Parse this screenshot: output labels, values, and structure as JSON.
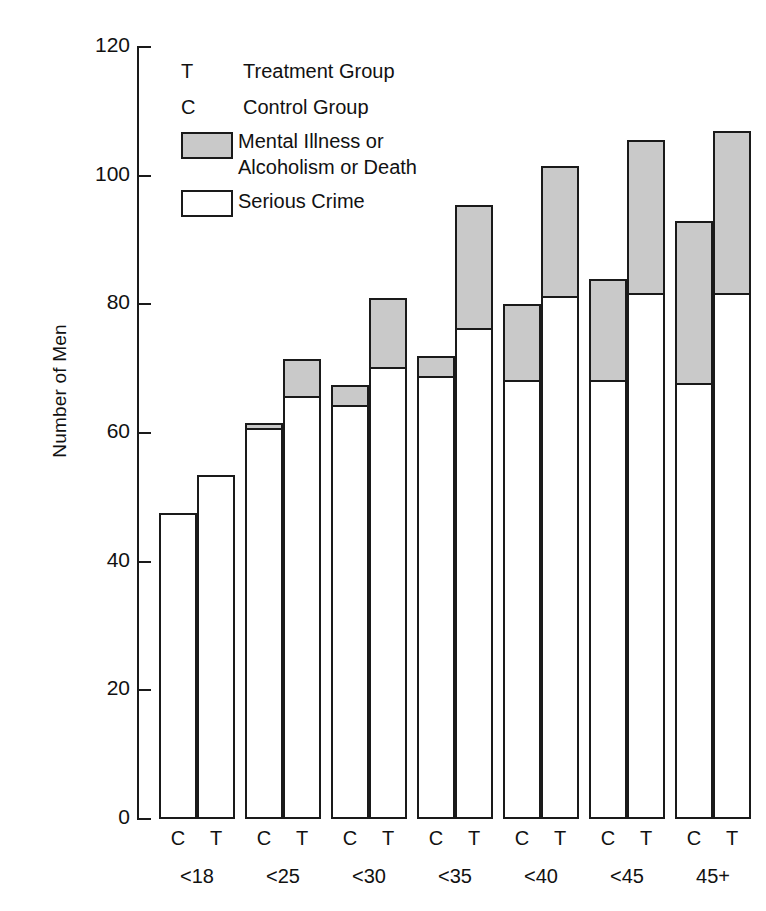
{
  "chart_data": {
    "type": "bar",
    "subtype": "stacked-grouped",
    "title": "",
    "xlabel": "",
    "ylabel": "Number of Men",
    "ylim": [
      0,
      120
    ],
    "yticks": [
      0,
      20,
      40,
      60,
      80,
      100,
      120
    ],
    "ytick_labels": [
      "0",
      "20",
      "40",
      "60",
      "80",
      "100",
      "120"
    ],
    "grid": false,
    "legend_position": "upper-left-inside",
    "categories": [
      "<18",
      "<25",
      "<30",
      "<35",
      "<40",
      "<45",
      "45+"
    ],
    "group_keys": [
      "C",
      "T"
    ],
    "stack_order_bottom_to_top": [
      "Serious Crime",
      "Mental Illness or Alcoholism or Death"
    ],
    "series": [
      {
        "name": "Serious Crime",
        "color": "#ffffff",
        "control_values": [
          47.5,
          60.5,
          64.0,
          68.5,
          68.0,
          68.0,
          67.5
        ],
        "treatment_values": [
          53.5,
          65.5,
          70.0,
          76.0,
          81.0,
          81.5,
          81.5
        ]
      },
      {
        "name": "Mental Illness or Alcoholism or Death",
        "color": "#c9c9c9",
        "control_values": [
          0.0,
          1.0,
          3.5,
          3.5,
          12.0,
          16.0,
          25.5
        ],
        "treatment_values": [
          0.0,
          6.0,
          11.0,
          19.5,
          20.5,
          24.0,
          25.5
        ]
      }
    ],
    "totals": {
      "control": [
        47.5,
        61.5,
        67.5,
        72.0,
        80.0,
        84.0,
        93.0
      ],
      "treatment": [
        53.5,
        71.5,
        81.0,
        95.5,
        101.5,
        105.5,
        107.0
      ]
    },
    "annotations": []
  },
  "axis": {
    "y_title": "Number of Men",
    "tick_labels": [
      "120",
      "100",
      "80",
      "60",
      "40",
      "20",
      "0"
    ],
    "tick_values": [
      120,
      100,
      80,
      60,
      40,
      20,
      0
    ]
  },
  "legend": {
    "rows": [
      {
        "key": "T",
        "swatch": "none",
        "label": "Treatment Group"
      },
      {
        "key": "C",
        "swatch": "none",
        "label": "Control Group"
      },
      {
        "key": "",
        "swatch": "gray",
        "label": "Mental Illness or\nAlcoholism or Death"
      },
      {
        "key": "",
        "swatch": "white",
        "label": "Serious Crime"
      }
    ]
  },
  "x_axis": {
    "groups": [
      {
        "label": "<18",
        "bars": [
          "C",
          "T"
        ]
      },
      {
        "label": "<25",
        "bars": [
          "C",
          "T"
        ]
      },
      {
        "label": "<30",
        "bars": [
          "C",
          "T"
        ]
      },
      {
        "label": "<35",
        "bars": [
          "C",
          "T"
        ]
      },
      {
        "label": "<40",
        "bars": [
          "C",
          "T"
        ]
      },
      {
        "label": "<45",
        "bars": [
          "C",
          "T"
        ]
      },
      {
        "label": "45+",
        "bars": [
          "C",
          "T"
        ]
      }
    ]
  },
  "colors": {
    "gray_segment": "#c9c9c9",
    "white_segment": "#ffffff",
    "outline": "#1a1a1a",
    "background": "#ffffff"
  }
}
